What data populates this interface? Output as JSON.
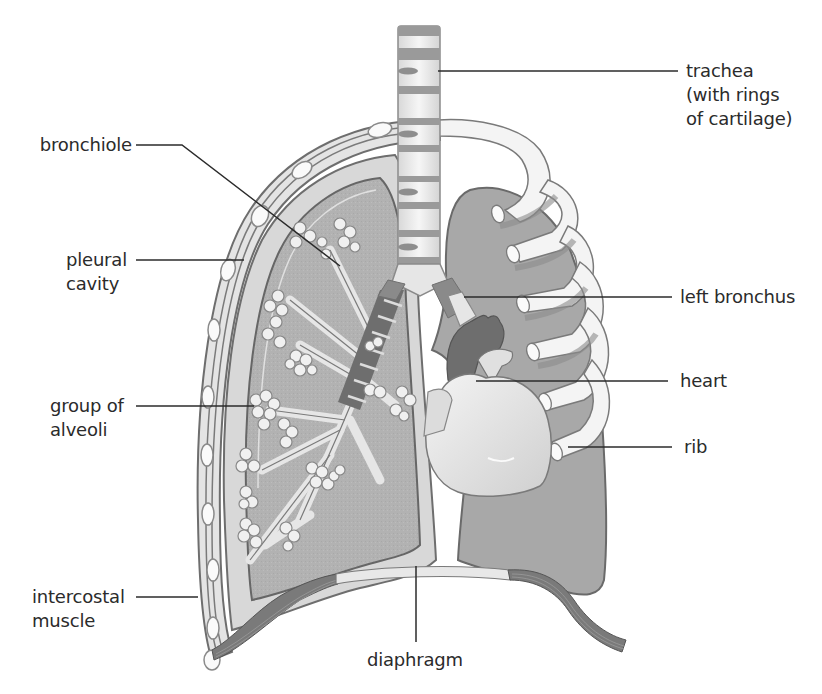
{
  "diagram": {
    "colors": {
      "background": "#ffffff",
      "lung_fill": "#b4b4b4",
      "lung_outline": "#6e6e6e",
      "pleura_fill": "#dcdcdc",
      "rib_fill": "#f2f2f2",
      "muscle_fill": "#8a8a8a",
      "heart_dark": "#6a6a6a",
      "heart_light": "#e6e6e6",
      "leader_line": "#2b2b2b",
      "label_text": "#2b2b2b"
    },
    "labels": {
      "left": [
        {
          "id": "bronchiole",
          "lines": [
            "bronchiole"
          ]
        },
        {
          "id": "pleural-cavity",
          "lines": [
            "pleural",
            "cavity"
          ]
        },
        {
          "id": "group-of-alveoli",
          "lines": [
            "group of",
            "alveoli"
          ]
        },
        {
          "id": "intercostal-muscle",
          "lines": [
            "intercostal",
            "muscle"
          ]
        }
      ],
      "right": [
        {
          "id": "trachea",
          "lines": [
            "trachea",
            "(with rings",
            "of cartilage)"
          ]
        },
        {
          "id": "left-bronchus",
          "lines": [
            "left bronchus"
          ]
        },
        {
          "id": "heart",
          "lines": [
            "heart"
          ]
        },
        {
          "id": "rib",
          "lines": [
            "rib"
          ]
        }
      ],
      "bottom": [
        {
          "id": "diaphragm",
          "lines": [
            "diaphragm"
          ]
        }
      ]
    }
  }
}
